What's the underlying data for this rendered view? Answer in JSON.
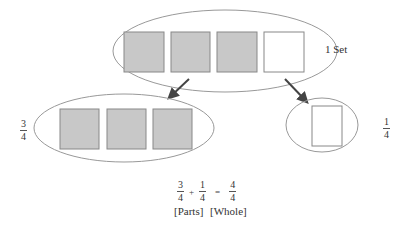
{
  "diagram": {
    "set_label": "1 Set",
    "left_group": {
      "fraction": {
        "numerator": "3",
        "denominator": "4"
      },
      "shaded_count": 3
    },
    "right_group": {
      "fraction": {
        "numerator": "1",
        "denominator": "4"
      },
      "unshaded_count": 1
    },
    "equation": {
      "term1": {
        "numerator": "3",
        "denominator": "4"
      },
      "plus": "+",
      "term2": {
        "numerator": "1",
        "denominator": "4"
      },
      "equals": "=",
      "result": {
        "numerator": "4",
        "denominator": "4"
      }
    },
    "caption": {
      "parts": "[Parts]",
      "whole": "[Whole]"
    },
    "colors": {
      "shaded": "#c8c8c8",
      "outline": "#808080",
      "arrow": "#444444"
    }
  }
}
